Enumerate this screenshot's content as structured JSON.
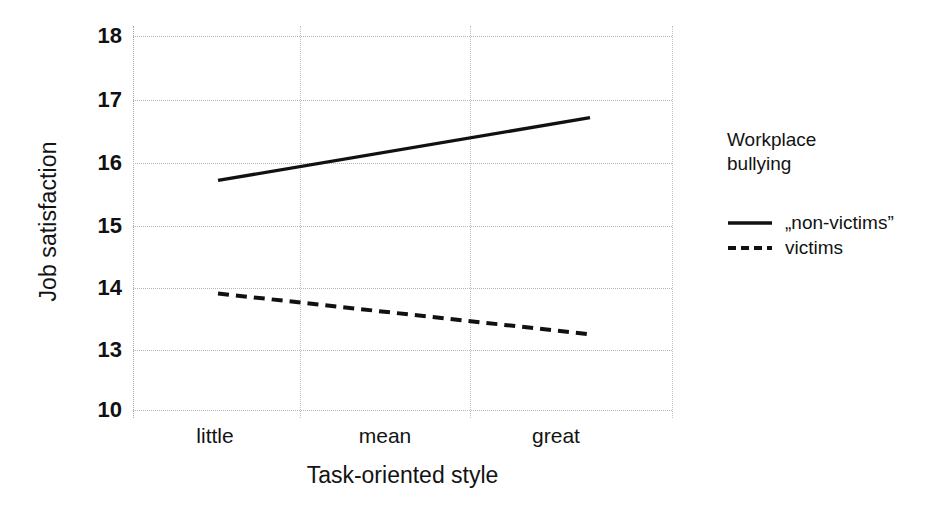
{
  "chart_data": {
    "type": "line",
    "title": "",
    "subtitle": "",
    "xlabel": "Task-oriented style",
    "ylabel": "Job satisfaction",
    "categories": [
      "little",
      "mean",
      "great"
    ],
    "x_tick_labels": [
      "little",
      "mean",
      "great"
    ],
    "y_tick_labels": [
      "18",
      "17",
      "16",
      "15",
      "14",
      "13",
      "10"
    ],
    "y_tick_values": [
      18,
      17,
      16,
      15,
      14,
      13,
      10
    ],
    "ylim": [
      10,
      18
    ],
    "grid": true,
    "legend_position": "right",
    "legend_title": "Workplace bullying",
    "series": [
      {
        "name": "„non-victims”",
        "style": "solid",
        "color": "#111111",
        "values": [
          15.7,
          16.2,
          16.7
        ]
      },
      {
        "name": "victims",
        "style": "dashed",
        "color": "#111111",
        "values": [
          13.9,
          13.57,
          13.25
        ]
      }
    ]
  },
  "axes": {
    "y_title": "Job satisfaction",
    "x_title": "Task-oriented style",
    "y_ticks": [
      {
        "label": "18",
        "value": 18
      },
      {
        "label": "17",
        "value": 17
      },
      {
        "label": "16",
        "value": 16
      },
      {
        "label": "15",
        "value": 15
      },
      {
        "label": "14",
        "value": 14
      },
      {
        "label": "13",
        "value": 13
      },
      {
        "label": "10",
        "value": 10
      }
    ],
    "x_ticks": [
      {
        "label": "little"
      },
      {
        "label": "mean"
      },
      {
        "label": "great"
      }
    ]
  },
  "legend": {
    "title_line_1": "Workplace",
    "title_line_2": "bullying",
    "entries": [
      {
        "label": "„non-victims”",
        "style": "solid"
      },
      {
        "label": "victims",
        "style": "dashed"
      }
    ]
  }
}
